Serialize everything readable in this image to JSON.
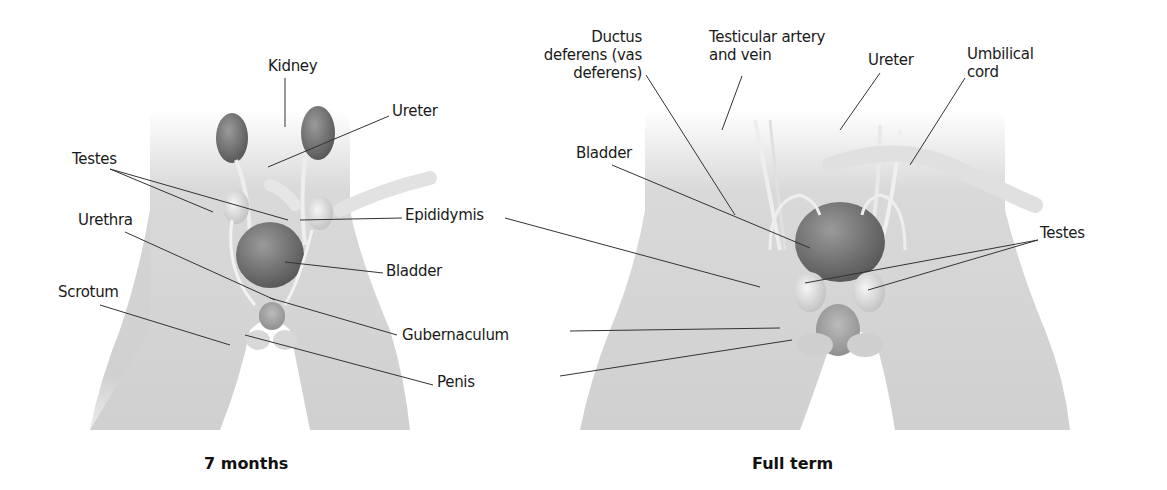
{
  "panels": [
    {
      "caption": "7 months",
      "labels": {
        "kidney": "Kidney",
        "ureter": "Ureter",
        "testes": "Testes",
        "urethra": "Urethra",
        "epididymis": "Epididymis",
        "bladder": "Bladder",
        "scrotum": "Scrotum",
        "gubernaculum": "Gubernaculum",
        "penis": "Penis"
      }
    },
    {
      "caption": "Full term",
      "labels": {
        "ductus_line1": "Ductus",
        "ductus_line2": "deferens (vas",
        "ductus_line3": "deferens)",
        "testicular_line1": "Testicular artery",
        "testicular_line2": "and vein",
        "ureter": "Ureter",
        "umbilical_line1": "Umbilical",
        "umbilical_line2": "cord",
        "bladder": "Bladder",
        "testes": "Testes"
      }
    }
  ],
  "colors": {
    "skin_light": "#e4e4e4",
    "skin_mid": "#c9c9c9",
    "organ_dark": "#6e6e6e",
    "organ_light": "#e9e9e9",
    "leader_line": "#333333"
  }
}
